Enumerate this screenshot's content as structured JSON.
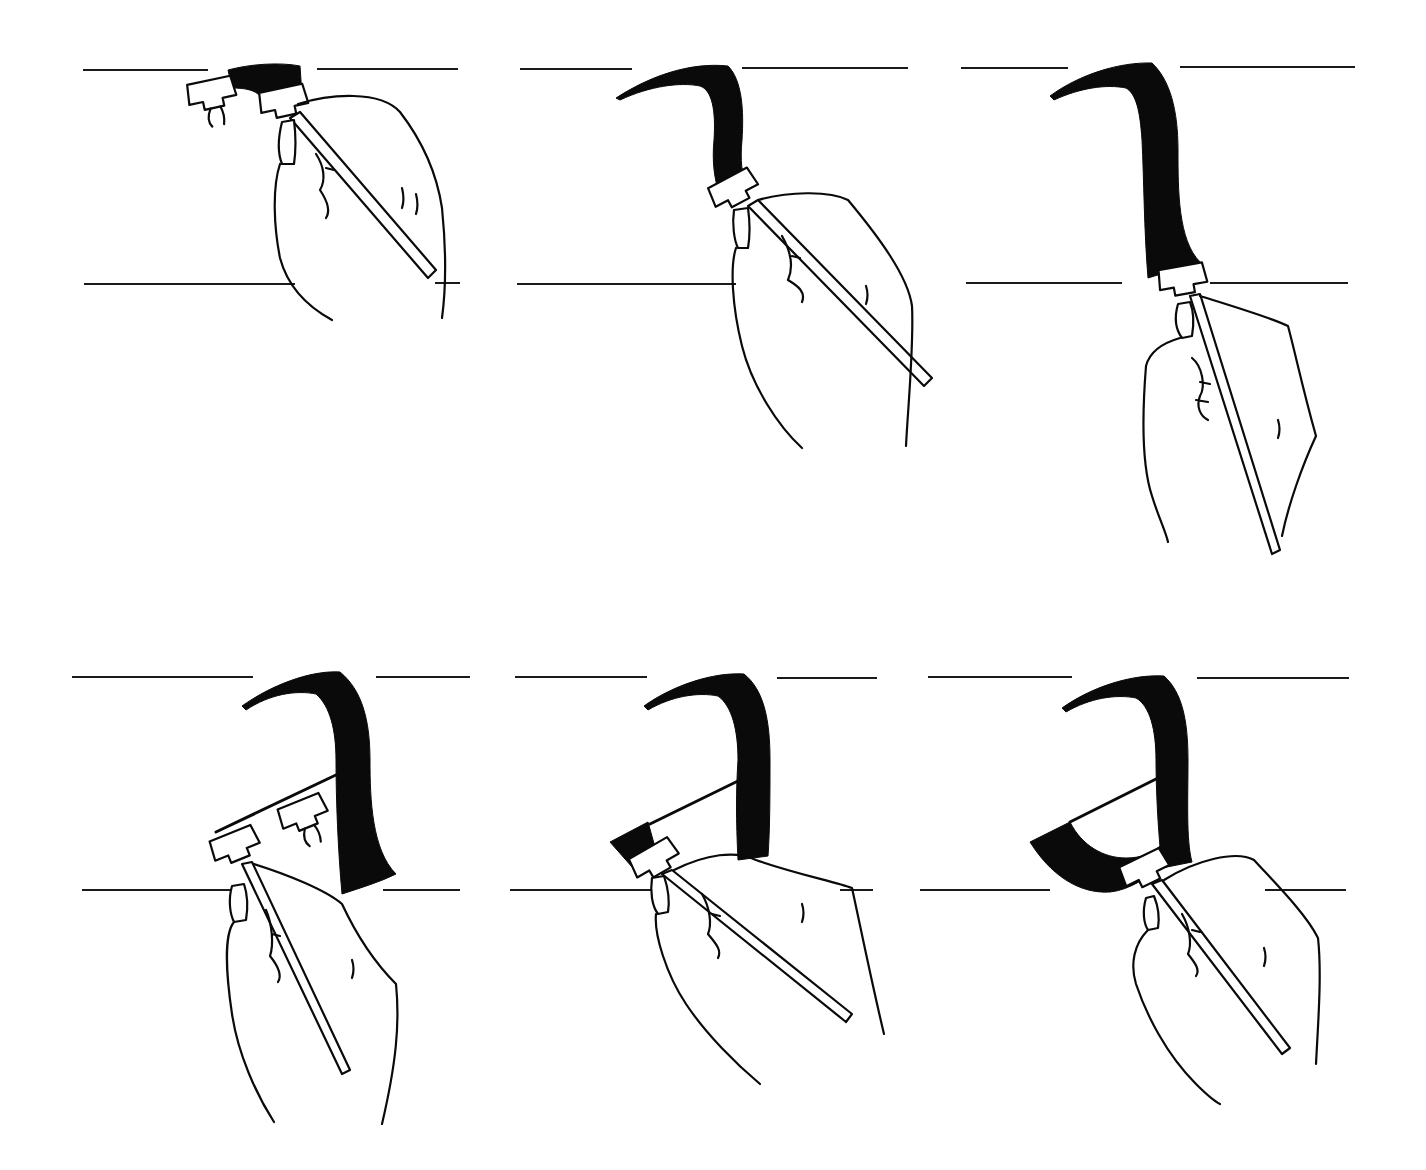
{
  "figure": {
    "title": "",
    "background": "#ffffff",
    "ink_color": "#0a0a0a",
    "panels": [
      {
        "id": 1,
        "row": 1,
        "col": 1,
        "step": "Pen placed at top guide line, beginning the arch stroke",
        "ascender_y": 70,
        "baseline_y": 284
      },
      {
        "id": 2,
        "row": 1,
        "col": 2,
        "step": "Arch stroke curving down from the top",
        "ascender_y": 69,
        "baseline_y": 284
      },
      {
        "id": 3,
        "row": 1,
        "col": 3,
        "step": "Downstroke completed to baseline",
        "ascender_y": 68,
        "baseline_y": 283
      },
      {
        "id": 4,
        "row": 2,
        "col": 1,
        "step": "Stem finished with exit curve; pen moved to start diagonal hairline",
        "ascender_y": 677,
        "baseline_y": 890
      },
      {
        "id": 5,
        "row": 2,
        "col": 2,
        "step": "Diagonal hairline drawn; bowl stroke begins",
        "ascender_y": 677,
        "baseline_y": 890
      },
      {
        "id": 6,
        "row": 2,
        "col": 3,
        "step": "Bowl closed, letter 'a' complete",
        "ascender_y": 677,
        "baseline_y": 890
      }
    ]
  }
}
